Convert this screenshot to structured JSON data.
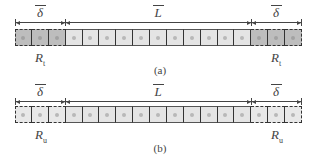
{
  "panels": [
    {
      "id": "a",
      "caption": "(a)",
      "left_segment": {
        "symbol": "δ",
        "cells": 3,
        "region_label": "R",
        "region_sub": "t",
        "fill": "dark"
      },
      "middle_segment": {
        "symbol": "L",
        "cells": 11,
        "fill": "light"
      },
      "right_segment": {
        "symbol": "δ",
        "cells": 3,
        "region_label": "R",
        "region_sub": "t",
        "fill": "dark"
      }
    },
    {
      "id": "b",
      "caption": "(b)",
      "left_segment": {
        "symbol": "δ",
        "cells": 3,
        "region_label": "R",
        "region_sub": "u",
        "fill": "light"
      },
      "middle_segment": {
        "symbol": "L",
        "cells": 11,
        "fill": "light"
      },
      "right_segment": {
        "symbol": "δ",
        "cells": 3,
        "region_label": "R",
        "region_sub": "u",
        "fill": "light"
      }
    }
  ],
  "colors": {
    "boundary_dark_cell": "#bdbdbd",
    "interior_cell": "#e4e4e4",
    "outline": "#333333"
  }
}
